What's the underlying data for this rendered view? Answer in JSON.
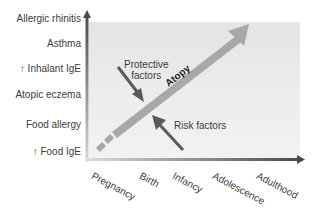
{
  "diagram": {
    "type": "atopic-march",
    "y_axis": {
      "labels": [
        "Allergic rhinitis",
        "Asthma",
        "↑ Inhalant IgE",
        "Atopic eczema",
        "Food allergy",
        "↑ Food IgE"
      ]
    },
    "x_axis": {
      "labels": [
        "Pregnancy",
        "Birth",
        "Infancy",
        "Adolescence",
        "Adulthood"
      ]
    },
    "main_arrow": {
      "label": "Atopy"
    },
    "annotations": {
      "protective_line1": "Protective",
      "protective_line2": "factors",
      "risk": "Risk factors"
    },
    "colors": {
      "panel": "#e8e8e8",
      "arrow": "#a8a8a8",
      "axis_dark": "#555555",
      "factor_arrow": "#5a5a5a"
    }
  }
}
